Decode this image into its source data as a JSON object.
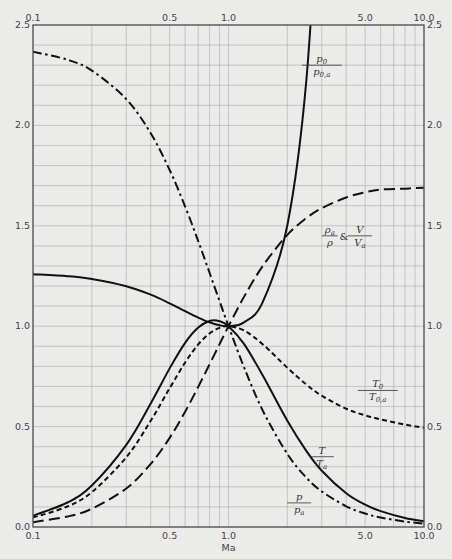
{
  "chart_data": {
    "type": "line",
    "title": "",
    "xlabel": "Ma",
    "ylabel": "",
    "xscale": "log",
    "xlim": [
      0.1,
      10.0
    ],
    "ylim": [
      0.0,
      2.5
    ],
    "grid": true,
    "x_ticks": [
      0.1,
      0.5,
      1.0,
      5.0,
      10.0
    ],
    "x_tick_labels": [
      "0.1",
      "0.5",
      "1.0",
      "5.0",
      "10.0"
    ],
    "y_ticks": [
      0.0,
      0.5,
      1.0,
      1.5,
      2.0,
      2.5
    ],
    "y_tick_labels": [
      "0.0",
      "0.5",
      "1.0",
      "1.5",
      "2.0",
      "2.5"
    ],
    "x_tick_positions": "top and bottom",
    "y_tick_positions": "left and right",
    "x": [
      0.1,
      0.15,
      0.2,
      0.3,
      0.4,
      0.5,
      0.6,
      0.7,
      0.8,
      0.9,
      1.0,
      1.2,
      1.5,
      2.0,
      2.5,
      3.0,
      4.0,
      5.0,
      6.0,
      8.0,
      10.0
    ],
    "series": [
      {
        "name": "p0/p0,a",
        "style": "solid",
        "values": [
          1.259,
          1.249,
          1.235,
          1.199,
          1.157,
          1.114,
          1.075,
          1.043,
          1.019,
          1.005,
          1.0,
          1.019,
          1.122,
          1.503,
          2.222,
          3.424,
          null,
          null,
          null,
          null,
          null
        ]
      },
      {
        "name": "ρa/ρ & V/Va",
        "style": "long-dash",
        "values": [
          0.024,
          0.052,
          0.091,
          0.192,
          0.314,
          0.444,
          0.574,
          0.698,
          0.81,
          0.911,
          1.0,
          1.146,
          1.301,
          1.455,
          1.538,
          1.588,
          1.641,
          1.667,
          1.681,
          1.685,
          1.69
        ]
      },
      {
        "name": "T0/T0,a",
        "style": "short-dash",
        "values": [
          0.047,
          0.102,
          0.174,
          0.347,
          0.529,
          0.691,
          0.819,
          0.909,
          0.964,
          0.992,
          1.0,
          0.979,
          0.909,
          0.793,
          0.71,
          0.654,
          0.589,
          0.556,
          0.536,
          0.51,
          0.495
        ]
      },
      {
        "name": "T/Ta",
        "style": "solid",
        "values": [
          0.056,
          0.122,
          0.207,
          0.409,
          0.615,
          0.79,
          0.917,
          0.993,
          1.026,
          1.025,
          1.0,
          0.912,
          0.753,
          0.529,
          0.379,
          0.28,
          0.168,
          0.111,
          0.079,
          0.045,
          0.029
        ]
      },
      {
        "name": "p/pa",
        "style": "dash-dot",
        "values": [
          2.367,
          2.327,
          2.273,
          2.131,
          1.961,
          1.778,
          1.596,
          1.424,
          1.266,
          1.125,
          1.0,
          0.796,
          0.578,
          0.364,
          0.246,
          0.177,
          0.103,
          0.067,
          0.047,
          0.027,
          0.017
        ]
      }
    ],
    "annotations": [
      {
        "series": "p0/p0,a",
        "numerator": "p",
        "num_sub": "0",
        "denominator": "p",
        "den_sub": "0,a",
        "near_x": 3.0,
        "near_y": 2.3
      },
      {
        "series": "ρa/ρ & V/Va",
        "numerator": "ρ",
        "num_sub": "a",
        "denominator": "ρ",
        "den_sub": "",
        "connector": "&",
        "numerator2": "V",
        "num2_sub": "",
        "denominator2": "V",
        "den2_sub": "a",
        "near_x": 3.3,
        "near_y": 1.45
      },
      {
        "series": "T0/T0,a",
        "numerator": "T",
        "num_sub": "0",
        "denominator": "T",
        "den_sub": "0,a",
        "near_x": 5.8,
        "near_y": 0.68
      },
      {
        "series": "T/Ta",
        "numerator": "T",
        "num_sub": "",
        "denominator": "T",
        "den_sub": "a",
        "near_x": 3.0,
        "near_y": 0.35
      },
      {
        "series": "p/pa",
        "numerator": "p",
        "num_sub": "",
        "denominator": "p",
        "den_sub": "a",
        "near_x": 2.3,
        "near_y": 0.12
      }
    ]
  }
}
